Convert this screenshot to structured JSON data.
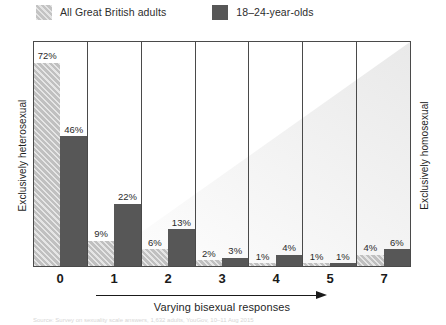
{
  "legend": {
    "items": [
      {
        "label": "All Great British adults",
        "swatch": "hatched-gray-swatch",
        "color": "#c3c3c3"
      },
      {
        "label": "18–24-year-olds",
        "swatch": "solid-dark-gray-swatch",
        "color": "#575757"
      }
    ]
  },
  "axes": {
    "left_title": "Exclusively heterosexual",
    "right_title": "Exclusively homosexual",
    "x_title": "Varying bisexual responses"
  },
  "source_note": "Source: Survey on sexuality scale answers, 1,632 adults, YouGov, 10–11 Aug 2015",
  "chart_data": {
    "type": "bar",
    "title": "",
    "subtitle": "",
    "xlabel": "Varying bisexual responses",
    "ylabel": "",
    "categories": [
      "0",
      "1",
      "2",
      "3",
      "4",
      "5",
      "7"
    ],
    "series": [
      {
        "name": "All Great British adults",
        "color": "#c0c0c0",
        "fill": "hatched",
        "values": [
          72,
          9,
          6,
          2,
          1,
          1,
          4
        ],
        "value_labels": [
          "72%",
          "9%",
          "6%",
          "2%",
          "1%",
          "1%",
          "4%"
        ]
      },
      {
        "name": "18–24-year-olds",
        "color": "#575757",
        "fill": "solid",
        "values": [
          46,
          22,
          13,
          3,
          4,
          1,
          6
        ],
        "value_labels": [
          "46%",
          "22%",
          "13%",
          "3%",
          "4%",
          "1%",
          "6%"
        ]
      }
    ],
    "ylim": [
      0,
      80
    ],
    "unit": "%",
    "grid": false,
    "legend_position": "top-left",
    "annotations": [
      "Exclusively heterosexual",
      "Exclusively homosexual",
      "Varying bisexual responses"
    ]
  }
}
